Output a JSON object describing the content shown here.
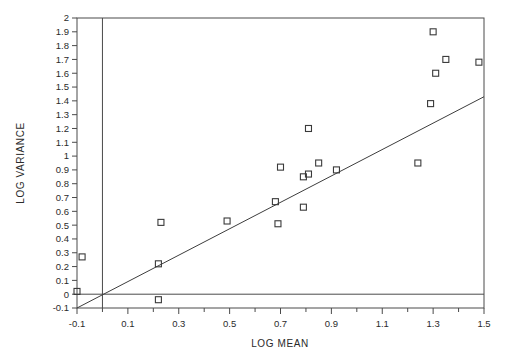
{
  "chart_data": {
    "type": "scatter",
    "title": "",
    "xlabel": "LOG MEAN",
    "ylabel": "LOG VARIANCE",
    "xlim": [
      -0.1,
      1.5
    ],
    "ylim": [
      -0.1,
      2.0
    ],
    "x_major_ticks": [
      -0.1,
      0.1,
      0.3,
      0.5,
      0.7,
      0.9,
      1.1,
      1.3,
      1.5
    ],
    "x_major_tick_labels": [
      "-0.1",
      "0.1",
      "0.3",
      "0.5",
      "0.7",
      "0.9",
      "1.1",
      "1.3",
      "1.5"
    ],
    "x_minor_ticks": [
      0.0,
      0.2,
      0.4,
      0.6,
      0.8,
      1.0,
      1.2,
      1.4
    ],
    "y_ticks": [
      -0.1,
      0,
      0.1,
      0.2,
      0.3,
      0.4,
      0.5,
      0.6,
      0.7,
      0.8,
      0.9,
      1.0,
      1.1,
      1.2,
      1.3,
      1.4,
      1.5,
      1.6,
      1.7,
      1.8,
      1.9,
      2.0
    ],
    "y_tick_labels": [
      "-0.1",
      "0",
      "0.1",
      "0.2",
      "0.3",
      "0.4",
      "0.5",
      "0.6",
      "0.7",
      "0.8",
      "0.9",
      "1",
      "1.1",
      "1.2",
      "1.3",
      "1.4",
      "1.5",
      "1.6",
      "1.7",
      "1.8",
      "1.9",
      "2"
    ],
    "grid": false,
    "legend": null,
    "marker": "open-square",
    "marker_color": "#3a3a3a",
    "points": [
      {
        "x": -0.1,
        "y": 0.02
      },
      {
        "x": -0.08,
        "y": 0.27
      },
      {
        "x": 0.22,
        "y": 0.22
      },
      {
        "x": 0.22,
        "y": -0.04
      },
      {
        "x": 0.23,
        "y": 0.52
      },
      {
        "x": 0.49,
        "y": 0.53
      },
      {
        "x": 0.68,
        "y": 0.67
      },
      {
        "x": 0.69,
        "y": 0.51
      },
      {
        "x": 0.7,
        "y": 0.92
      },
      {
        "x": 0.79,
        "y": 0.85
      },
      {
        "x": 0.79,
        "y": 0.63
      },
      {
        "x": 0.81,
        "y": 0.87
      },
      {
        "x": 0.81,
        "y": 1.2
      },
      {
        "x": 0.85,
        "y": 0.95
      },
      {
        "x": 0.92,
        "y": 0.9
      },
      {
        "x": 1.24,
        "y": 0.95
      },
      {
        "x": 1.29,
        "y": 1.38
      },
      {
        "x": 1.3,
        "y": 1.9
      },
      {
        "x": 1.31,
        "y": 1.6
      },
      {
        "x": 1.35,
        "y": 1.7
      },
      {
        "x": 1.48,
        "y": 1.68
      }
    ],
    "reference_lines": [
      {
        "name": "vertical-zero-line",
        "orientation": "vertical",
        "value": 0.0
      },
      {
        "name": "horizontal-zero-line",
        "orientation": "horizontal",
        "value": 0.0
      }
    ],
    "fit_line": {
      "name": "regression-line",
      "x_start": -0.1,
      "y_start": -0.1,
      "x_end": 1.5,
      "y_end": 1.43
    }
  }
}
